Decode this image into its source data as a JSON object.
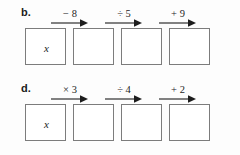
{
  "diagram": {
    "type": "function-machine-chain",
    "variable": "x",
    "rows": [
      {
        "id": "b",
        "label": "b.",
        "start_value": "x",
        "boxes": [
          "x",
          "",
          "",
          ""
        ],
        "operations": [
          "− 8",
          "÷ 5",
          "+ 9"
        ]
      },
      {
        "id": "d",
        "label": "d.",
        "start_value": "x",
        "boxes": [
          "x",
          "",
          "",
          ""
        ],
        "operations": [
          "× 3",
          "÷ 4",
          "+ 2"
        ]
      }
    ],
    "colors": {
      "box_border": "#7c7c7c",
      "box_fill": "#ffffff",
      "text": "#1d1d1d",
      "page_background": "#fdfdfd",
      "arrow": "#1d1d1d"
    }
  }
}
